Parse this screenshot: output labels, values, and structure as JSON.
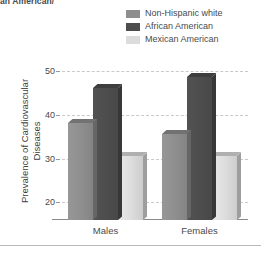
{
  "clipped_caption": "an American/",
  "legend": {
    "position": "top-right",
    "items": [
      {
        "label": "Non-Hispanic white",
        "color": "#8e8e8e",
        "swatch_name": "legend-swatch-non-hispanic-white"
      },
      {
        "label": "African American",
        "color": "#4d4d4d",
        "swatch_name": "legend-swatch-african-american"
      },
      {
        "label": "Mexican American",
        "color": "#dcdcdc",
        "swatch_name": "legend-swatch-mexican-american"
      }
    ]
  },
  "axes": {
    "ylabel_line1": "Prevalence of Cardiovascular",
    "ylabel_line2": "Diseases",
    "yticks": [
      50,
      40,
      30,
      20
    ],
    "xlabels": [
      "Males",
      "Females"
    ]
  },
  "chart_data": {
    "type": "bar",
    "title": "",
    "xlabel": "",
    "ylabel": "Prevalence of Cardiovascular Diseases",
    "categories": [
      "Males",
      "Females"
    ],
    "series": [
      {
        "name": "Non-Hispanic white",
        "color": "#8e8e8e",
        "values": [
          38,
          35.5
        ]
      },
      {
        "name": "African American",
        "color": "#4d4d4d",
        "values": [
          46,
          48.5
        ]
      },
      {
        "name": "Mexican American",
        "color": "#dcdcdc",
        "values": [
          30.5,
          30.5
        ]
      }
    ],
    "ylim": [
      16,
      52
    ],
    "yticks": [
      20,
      30,
      40,
      50
    ],
    "grid": "horizontal-dashed",
    "legend_position": "top-right",
    "bar_style": "3d-extruded"
  }
}
